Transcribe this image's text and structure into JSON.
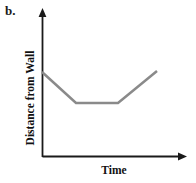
{
  "figure": {
    "part_label": "b.",
    "background_color": "#ffffff"
  },
  "chart_data": {
    "type": "line",
    "title": "",
    "subtitle": "",
    "xlabel": "Time",
    "ylabel": "Distance from Wall",
    "grid": false,
    "legend": null,
    "axis_color": "#1a1a1a",
    "line_color": "#8a8a8a",
    "line_width": 2.5,
    "xlim": [
      0,
      10
    ],
    "ylim": [
      0,
      10
    ],
    "x_tick_labels": [],
    "y_tick_labels": [],
    "axes_arrows": {
      "x_axis_arrow": true,
      "y_axis_arrow": true
    },
    "series": [
      {
        "name": "distance-from-wall",
        "x": [
          0.0,
          3.1,
          6.9,
          10.5
        ],
        "y": [
          5.85,
          3.7,
          3.7,
          5.95
        ],
        "points_px": [
          {
            "x": 42,
            "y": 72
          },
          {
            "x": 76,
            "y": 103
          },
          {
            "x": 118,
            "y": 103
          },
          {
            "x": 157,
            "y": 71
          }
        ]
      }
    ],
    "segments": [
      {
        "name": "walking-toward-wall",
        "slope": "negative"
      },
      {
        "name": "standing-still",
        "slope": "zero"
      },
      {
        "name": "walking-away-from-wall",
        "slope": "positive"
      }
    ]
  }
}
